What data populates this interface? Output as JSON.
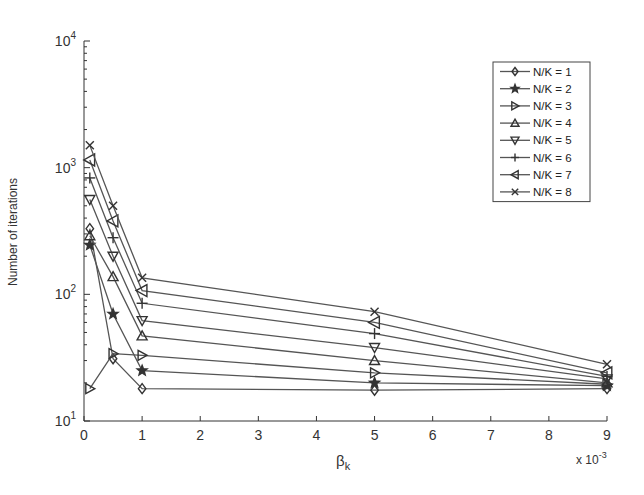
{
  "chart_data": {
    "type": "line",
    "title": "",
    "xlabel": "β_k",
    "xlabel_main": "β",
    "xlabel_sub": "k",
    "ylabel": "Number of iterations",
    "x_multiplier": "x 10",
    "x_multiplier_exp": "-3",
    "xscale": "linear",
    "yscale": "log",
    "xlim": [
      0,
      9
    ],
    "ylim": [
      10,
      10000
    ],
    "xticks": [
      0,
      1,
      2,
      3,
      4,
      5,
      6,
      7,
      8,
      9
    ],
    "xtick_labels": [
      "0",
      "1",
      "2",
      "3",
      "4",
      "5",
      "6",
      "7",
      "8",
      "9"
    ],
    "yticks": [
      10,
      100,
      1000,
      10000
    ],
    "ytick_labels": [
      {
        "base": "10",
        "exp": "1"
      },
      {
        "base": "10",
        "exp": "2"
      },
      {
        "base": "10",
        "exp": "3"
      },
      {
        "base": "10",
        "exp": "4"
      }
    ],
    "grid": false,
    "legend_position": "upper right",
    "x": [
      0.1,
      0.5,
      1,
      5,
      9
    ],
    "series": [
      {
        "name": "N/K = 1",
        "marker": "diamond",
        "values": [
          330,
          31,
          18,
          17.5,
          18
        ]
      },
      {
        "name": "N/K = 2",
        "marker": "star",
        "values": [
          245,
          70,
          25,
          20,
          19
        ]
      },
      {
        "name": "N/K = 3",
        "marker": "triangle-right",
        "values": [
          18,
          34,
          33,
          24,
          19.5
        ]
      },
      {
        "name": "N/K = 4",
        "marker": "triangle-up",
        "values": [
          290,
          138,
          47,
          30,
          20
        ]
      },
      {
        "name": "N/K = 5",
        "marker": "triangle-down",
        "values": [
          560,
          200,
          62,
          38,
          21.5
        ]
      },
      {
        "name": "N/K = 6",
        "marker": "plus",
        "values": [
          830,
          280,
          85,
          49,
          22.5
        ]
      },
      {
        "name": "N/K = 7",
        "marker": "triangle-left",
        "values": [
          1150,
          380,
          107,
          60,
          24
        ]
      },
      {
        "name": "N/K = 8",
        "marker": "x",
        "values": [
          1500,
          500,
          135,
          73,
          28
        ]
      }
    ]
  }
}
